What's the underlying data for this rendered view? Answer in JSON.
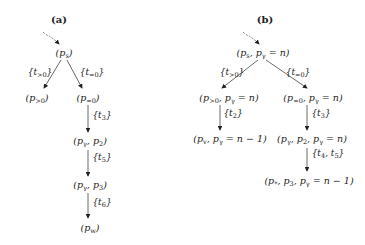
{
  "panels": {
    "a": {
      "title": "(a)",
      "nodes": {
        "root": {
          "base": "p",
          "sub": "s"
        },
        "gt0": {
          "base": "p",
          "sub": ">0"
        },
        "eq0": {
          "base": "p",
          "sub": "=0"
        },
        "pg_p2": {
          "text": "p",
          "sub": "γ",
          "rest": ", p",
          "rest_sub": "2"
        },
        "pg_p3": {
          "text": "p",
          "sub": "γ",
          "rest": ", p",
          "rest_sub": "3"
        },
        "pw": {
          "base": "p",
          "sub": "w"
        }
      },
      "edges": {
        "t_gt0": {
          "open": "{t",
          "sub": ">0",
          "close": "}"
        },
        "t_eq0": {
          "open": "{t",
          "sub": "=0",
          "close": "}"
        },
        "t3": {
          "open": "{t",
          "sub": "3",
          "close": "}"
        },
        "t5": {
          "open": "{t",
          "sub": "5",
          "close": "}"
        },
        "t6": {
          "open": "{t",
          "sub": "6",
          "close": "}"
        }
      }
    },
    "b": {
      "title": "(b)",
      "nodes": {
        "root": {
          "p1": "p",
          "s1": "s",
          "p2": ", p",
          "s2": "γ",
          "rest": " = n"
        },
        "gt0": {
          "p1": "p",
          "s1": ">0",
          "p2": ", p",
          "s2": "γ",
          "rest": " = n"
        },
        "eq0": {
          "p1": "p",
          "s1": "=0",
          "p2": ", p",
          "s2": "γ",
          "rest": " = n"
        },
        "pv": {
          "p1": "p",
          "s1": "v",
          "p2": ", p",
          "s2": "γ",
          "rest": " = n − 1"
        },
        "pg_p2": {
          "p1": "p",
          "s1": "γ",
          "p2": ", p",
          "s2": "2",
          "p3": ", p",
          "s3": "γ",
          "rest": " = n"
        },
        "pstar": {
          "p1": "p",
          "s1": "*",
          "p2": ", p",
          "s2": "3",
          "p3": ", p",
          "s3": "γ",
          "rest": " = n − 1"
        }
      },
      "edges": {
        "t_gt0": {
          "open": "{t",
          "sub": ">0",
          "close": "}"
        },
        "t_eq0": {
          "open": "{t",
          "sub": "=0",
          "close": "}"
        },
        "t2": {
          "open": "{t",
          "sub": "2",
          "close": "}"
        },
        "t3": {
          "open": "{t",
          "sub": "3",
          "close": "}"
        },
        "t45": {
          "open": "{t",
          "sub": "4",
          "mid": ", t",
          "sub2": "5",
          "close": "}"
        }
      }
    }
  },
  "colors": {
    "ink": "#222222",
    "background": "#ffffff"
  }
}
